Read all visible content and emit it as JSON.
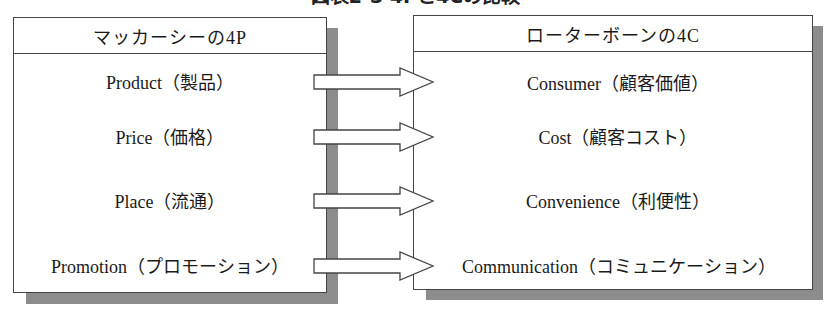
{
  "title": "図表2-3 4Pと4Cの比較",
  "left_box": {
    "header": "マッカーシーの4P",
    "items": [
      {
        "label": "Product（製品）"
      },
      {
        "label": "Price（価格）"
      },
      {
        "label": "Place（流通）"
      },
      {
        "label": "Promotion（プロモーション）"
      }
    ]
  },
  "right_box": {
    "header": "ローターボーンの4C",
    "items": [
      {
        "label": "Consumer（顧客価値）"
      },
      {
        "label": "Cost（顧客コスト）"
      },
      {
        "label": "Convenience（利便性）"
      },
      {
        "label": "Communication（コミュニケーション）"
      }
    ]
  },
  "arrows": [
    {
      "icon": "right-arrow-icon"
    },
    {
      "icon": "right-arrow-icon"
    },
    {
      "icon": "right-arrow-icon"
    },
    {
      "icon": "right-arrow-icon"
    }
  ],
  "colors": {
    "border": "#444444",
    "shadow": "#8c8c8c",
    "background": "#ffffff",
    "text": "#1a1a1a"
  }
}
